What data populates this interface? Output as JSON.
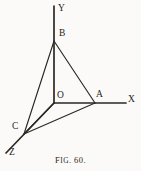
{
  "figure": {
    "caption_prefix": "F",
    "caption_smallcaps": "IG",
    "caption_number": ". 60.",
    "caption_full": "FIG. 60.",
    "ink_color": "#2b2825",
    "paper_color": "#fbfaf8",
    "vertices": [
      {
        "name": "Y",
        "label": "Y",
        "label_x": 58,
        "label_y": 4
      },
      {
        "name": "B",
        "label": "B",
        "label_x": 59,
        "label_y": 29
      },
      {
        "name": "O",
        "label": "O",
        "label_x": 57,
        "label_y": 91
      },
      {
        "name": "A",
        "label": "A",
        "label_x": 96,
        "label_y": 90
      },
      {
        "name": "X",
        "label": "X",
        "label_x": 128,
        "label_y": 95
      },
      {
        "name": "C",
        "label": "C",
        "label_x": 12,
        "label_y": 122
      },
      {
        "name": "Z",
        "label": "Z",
        "label_x": 9,
        "label_y": 148
      }
    ],
    "points": {
      "origin": [
        54,
        103
      ],
      "B": [
        54,
        41
      ],
      "A": [
        95,
        103
      ],
      "C": [
        24,
        134
      ],
      "Y_tip": [
        54,
        6
      ],
      "X_tip": [
        126,
        103
      ],
      "Z_tip": [
        6,
        153
      ]
    },
    "axes": [
      {
        "name": "y-axis",
        "label": "Y",
        "from": [
          54,
          6
        ],
        "to": [
          54,
          103
        ]
      },
      {
        "name": "x-axis",
        "label": "X",
        "from": [
          54,
          103
        ],
        "to": [
          126,
          103
        ]
      },
      {
        "name": "z-axis",
        "label": "Z",
        "from": [
          54,
          103
        ],
        "to": [
          6,
          153
        ]
      }
    ],
    "edges": [
      {
        "name": "edge-B-A",
        "from": [
          54,
          41
        ],
        "to": [
          95,
          103
        ]
      },
      {
        "name": "edge-B-C",
        "from": [
          54,
          41
        ],
        "to": [
          24,
          134
        ]
      },
      {
        "name": "edge-A-C",
        "from": [
          95,
          103
        ],
        "to": [
          24,
          134
        ]
      },
      {
        "name": "edge-O-A",
        "from": [
          54,
          103
        ],
        "to": [
          95,
          103
        ]
      },
      {
        "name": "edge-O-C",
        "from": [
          54,
          103
        ],
        "to": [
          24,
          134
        ]
      }
    ]
  }
}
